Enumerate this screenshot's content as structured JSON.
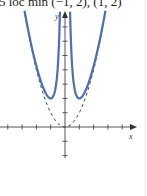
{
  "heading": "5 loc min (−1, 2), (1, 2)",
  "colors": {
    "curve": "#4a6fb5",
    "asymptote": "#444444",
    "axis": "#555555"
  },
  "chart_data": {
    "type": "line",
    "title": "",
    "xlabel": "x",
    "ylabel": "y",
    "xlim": [
      -4.5,
      5
    ],
    "ylim": [
      -2.1,
      8.2
    ],
    "grid": false,
    "x_tick_spacing": 1,
    "y_tick_spacing": 1,
    "series": [
      {
        "name": "f(x) = x^2 + 1/x^2",
        "style": "solid",
        "color": "#4a6fb5",
        "local_minima": [
          [
            -1,
            2
          ],
          [
            1,
            2
          ]
        ],
        "x": [
          -2.83,
          -2.5,
          -2,
          -1.5,
          -1.25,
          -1,
          -0.75,
          -0.5,
          -0.36,
          0.36,
          0.5,
          0.75,
          1,
          1.25,
          1.5,
          2,
          2.5,
          2.83
        ],
        "y": [
          8.13,
          6.41,
          4.25,
          2.69,
          2.2,
          2.0,
          2.34,
          4.25,
          7.85,
          7.85,
          4.25,
          2.34,
          2.0,
          2.2,
          2.69,
          4.25,
          6.41,
          8.13
        ]
      },
      {
        "name": "y = x^2 (asymptotic curve)",
        "style": "dashed",
        "color": "#444444",
        "x": [
          -2.8,
          -2,
          -1,
          0,
          1,
          2,
          2.8
        ],
        "y": [
          7.84,
          4,
          1,
          0,
          1,
          4,
          7.84
        ]
      }
    ],
    "annotations": [
      "5 loc min (−1, 2), (1, 2)"
    ]
  },
  "axes": {
    "x_label": "x",
    "y_label": "y"
  }
}
